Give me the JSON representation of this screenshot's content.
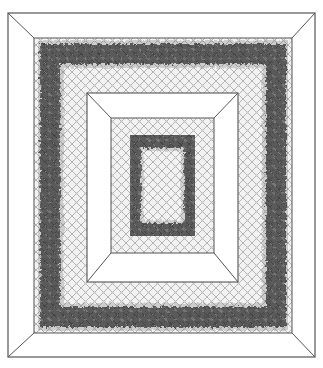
{
  "figure": {
    "caption_text": "",
    "colors": {
      "background": "#ffffff",
      "line": "#555555",
      "grid_line": "#9a9a9a",
      "grid_fill": "#ececec",
      "dark_ring": "#3a3a3a",
      "mid_ring": "#6e6e6e"
    },
    "geometry": {
      "outer_frame": [
        8,
        13,
        315,
        357
      ],
      "outer_panel": [
        34,
        38,
        292,
        333
      ],
      "inner_frame": [
        87,
        93,
        238,
        282
      ],
      "inner_panel": [
        111,
        118,
        214,
        253
      ],
      "outer_ring_center_inset": 16,
      "outer_ring_width": 20,
      "inner_ring_center_inset": 22,
      "inner_ring_width": 16,
      "grid_spacing": 9
    }
  }
}
